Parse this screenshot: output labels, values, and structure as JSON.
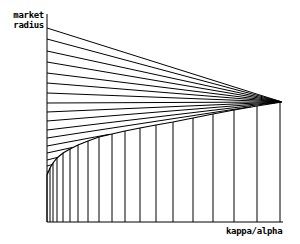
{
  "chart_data": {
    "type": "line",
    "title": "",
    "ylabel": "market radius",
    "ylabel_lines": [
      "market",
      "radius"
    ],
    "xlabel": "kappa/alpha",
    "grid": false,
    "legend": null,
    "convergence_point_px": [
      282,
      102
    ],
    "envelope_curve_px": [
      [
        47,
        175
      ],
      [
        50,
        168
      ],
      [
        53,
        163
      ],
      [
        57,
        158
      ],
      [
        63,
        153
      ],
      [
        70,
        149
      ],
      [
        78,
        145
      ],
      [
        88,
        141
      ],
      [
        99,
        137
      ],
      [
        112,
        134
      ],
      [
        125,
        131
      ],
      [
        140,
        128
      ],
      [
        156,
        125
      ],
      [
        173,
        122
      ],
      [
        193,
        118
      ],
      [
        213,
        114
      ],
      [
        234,
        110
      ],
      [
        257,
        106
      ],
      [
        282,
        102
      ]
    ],
    "ray_start_y_px": [
      28,
      39,
      51,
      62,
      73,
      83,
      93,
      103,
      112,
      121,
      130,
      138,
      146,
      153,
      160,
      166,
      172
    ],
    "vertical_lines_x_px": [
      47,
      50,
      53,
      57,
      63,
      70,
      78,
      88,
      99,
      112,
      125,
      140,
      156,
      173,
      193,
      213,
      234,
      257,
      280
    ],
    "axis_origin_px": [
      47,
      222
    ],
    "xaxis_end_px": 283,
    "yaxis_top_px": 14
  },
  "labels": {
    "y_line1": "market",
    "y_line2": "radius",
    "x": "kappa/alpha"
  }
}
